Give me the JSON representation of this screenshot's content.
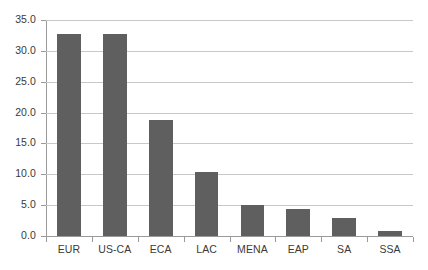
{
  "chart_data": {
    "type": "bar",
    "title": "",
    "subtitle": "",
    "xlabel": "",
    "ylabel": "",
    "categories": [
      "EUR",
      "US-CA",
      "ECA",
      "LAC",
      "MENA",
      "EAP",
      "SA",
      "SSA"
    ],
    "values": [
      32.7,
      32.7,
      18.8,
      10.3,
      5.0,
      4.4,
      2.9,
      0.8
    ],
    "ylim": [
      0.0,
      35.0
    ],
    "ytick_step": 5.0,
    "ytick_labels": [
      "35.0",
      "30.0",
      "25.0",
      "20.0",
      "15.0",
      "10.0",
      "5.0",
      "0.0"
    ],
    "ytick_values": [
      35.0,
      30.0,
      25.0,
      20.0,
      15.0,
      10.0,
      5.0,
      0.0
    ],
    "grid": true,
    "grid_axis": "y",
    "legend": false,
    "legend_position": "none",
    "data_labels": false,
    "orientation": "vertical",
    "series": [
      {
        "name": "",
        "values": [
          32.7,
          32.7,
          18.8,
          10.3,
          5.0,
          4.4,
          2.9,
          0.8
        ]
      }
    ]
  },
  "style": {
    "bar_color": "#5f5f5f",
    "gridline_color": "#c8c8c8",
    "axis_color": "#9a9a9a",
    "background_color": "#ffffff",
    "text_color": "#3a3a3a"
  }
}
